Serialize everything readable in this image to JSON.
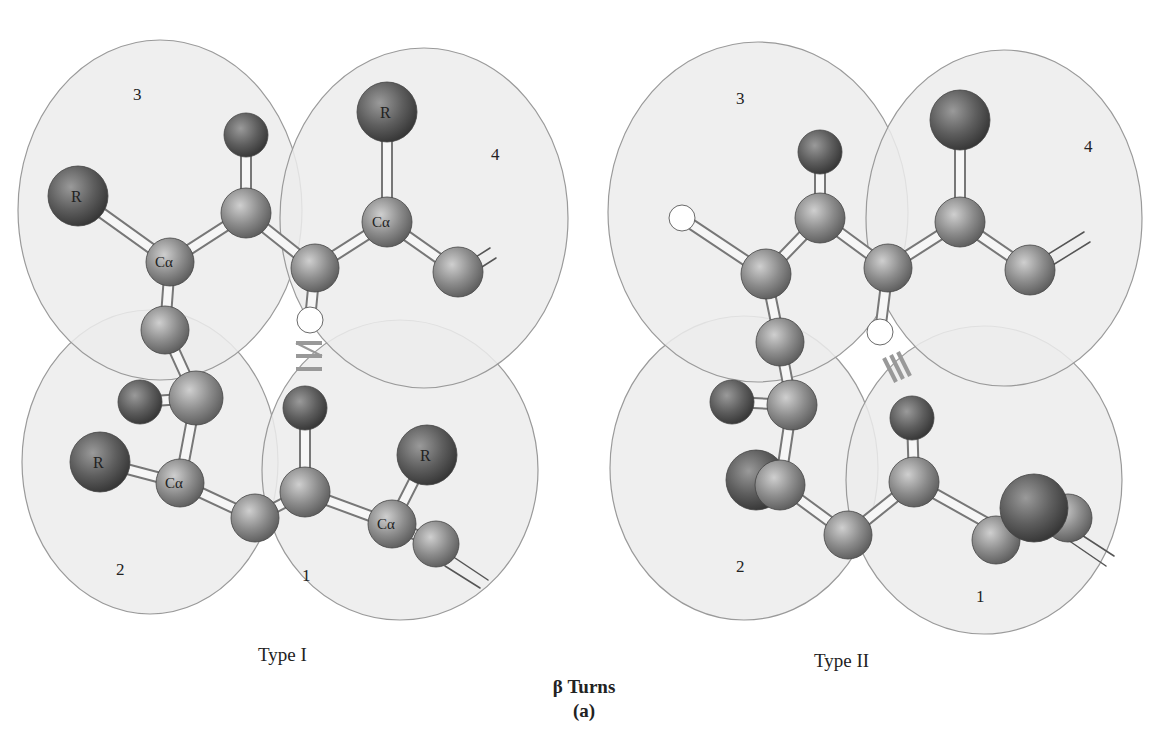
{
  "figure": {
    "title_symbol": "β",
    "title": "β Turns",
    "sublabel": "(a)"
  },
  "panels": [
    {
      "caption": "Type I",
      "residue_labels": [
        "1",
        "2",
        "3",
        "4"
      ],
      "atom_labels": [
        "R",
        "Cα",
        "R",
        "Cα",
        "R",
        "Cα",
        "R",
        "Cα"
      ],
      "hydrogen_bond": "≡"
    },
    {
      "caption": "Type II",
      "residue_labels": [
        "1",
        "2",
        "3",
        "4"
      ],
      "hydrogen_bond": "≡"
    }
  ],
  "colors": {
    "residue_circle_fill": "#ececec",
    "residue_circle_stroke": "#9a9a9a",
    "atom_dark": "#555555",
    "atom_mid": "#8a8a8a",
    "bond": "#f4f4f4",
    "hbond": "#9a9a9a"
  }
}
